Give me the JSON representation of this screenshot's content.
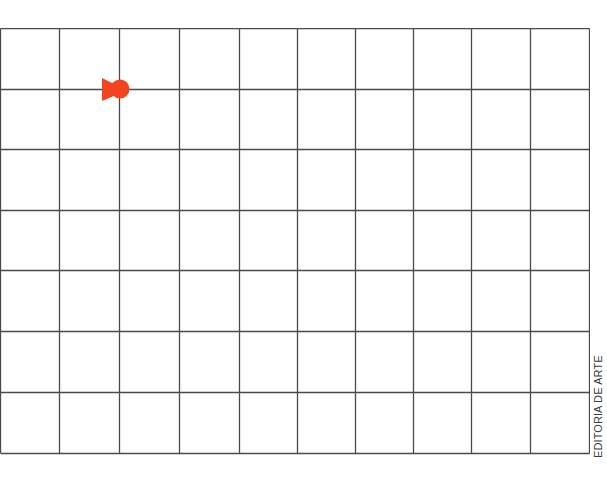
{
  "diagram": {
    "type": "grid",
    "columns": 10,
    "rows": 7,
    "line_color": "#4a4a4a",
    "background": "#ffffff",
    "column_lines_x": [
      0,
      59,
      119,
      179,
      239,
      297,
      355,
      413,
      471,
      530,
      589
    ],
    "row_lines_y": [
      28,
      89,
      149,
      210,
      270,
      331,
      392,
      453
    ]
  },
  "marker": {
    "icon": "pawn-arrow-icon",
    "color": "#f4431f",
    "grid_position": {
      "column_line": 2,
      "row_line": 1
    },
    "direction": "right"
  },
  "credit": {
    "text": "EDITORIA DE ARTE"
  }
}
